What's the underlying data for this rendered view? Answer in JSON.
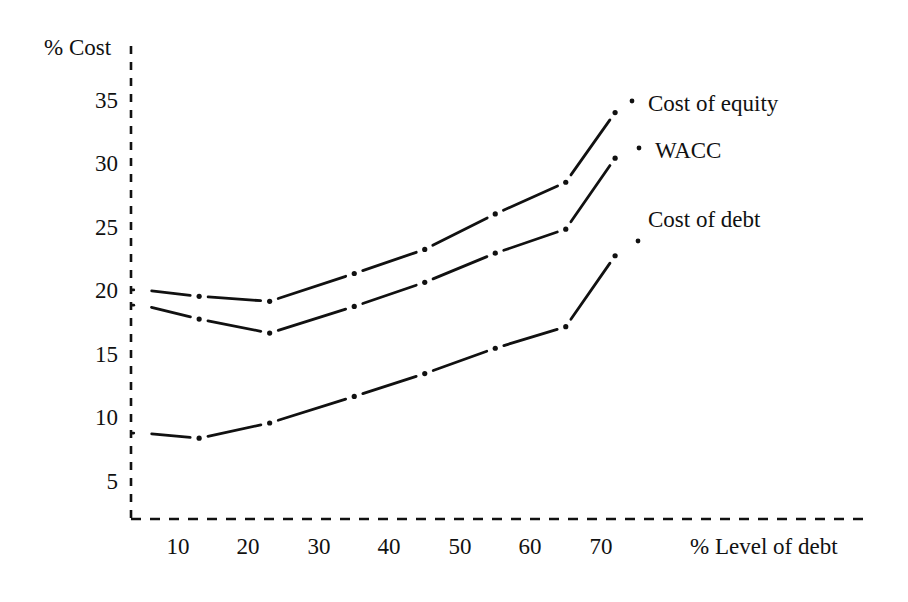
{
  "chart_data": {
    "type": "line",
    "title": "",
    "xlabel": "% Level of debt",
    "ylabel": "% Cost",
    "x": [
      5,
      13,
      23,
      35,
      45,
      55,
      65,
      72
    ],
    "xlim": [
      0,
      78
    ],
    "ylim": [
      0,
      38
    ],
    "xticks": [
      "10",
      "20",
      "30",
      "40",
      "50",
      "60",
      "70"
    ],
    "xtick_values": [
      10,
      20,
      30,
      40,
      50,
      60,
      70
    ],
    "yticks": [
      "5",
      "10",
      "15",
      "20",
      "25",
      "30",
      "35"
    ],
    "ytick_values": [
      5,
      10,
      15,
      20,
      25,
      30,
      35
    ],
    "grid": false,
    "legend_position": "right-inline-annotations",
    "series": [
      {
        "name": "Cost of equity",
        "values": [
          20.0,
          19.5,
          19.1,
          21.3,
          23.2,
          26.0,
          28.5,
          34.0
        ],
        "color": "#111111"
      },
      {
        "name": "WACC",
        "values": [
          18.8,
          17.7,
          16.6,
          18.7,
          20.6,
          22.9,
          24.8,
          30.4
        ],
        "color": "#111111"
      },
      {
        "name": "Cost of debt",
        "values": [
          8.7,
          8.3,
          9.5,
          11.6,
          13.4,
          15.4,
          17.1,
          22.7
        ],
        "color": "#111111"
      }
    ],
    "annotations": [
      {
        "text": "Cost of equity",
        "x": 648,
        "y": 99
      },
      {
        "text": "WACC",
        "x": 652,
        "y": 146
      },
      {
        "text": "Cost of debt",
        "x": 648,
        "y": 215
      }
    ]
  },
  "axes": {
    "y_axis_label": "% Cost",
    "x_axis_label": "% Level of debt",
    "y_axis_style": "dashed",
    "x_axis_style": "dashed",
    "axis_color": "#111111"
  },
  "ytick_labels": [
    "35",
    "30",
    "25",
    "20",
    "15",
    "10",
    "5"
  ],
  "xtick_labels": [
    "10",
    "20",
    "30",
    "40",
    "50",
    "60",
    "70"
  ]
}
